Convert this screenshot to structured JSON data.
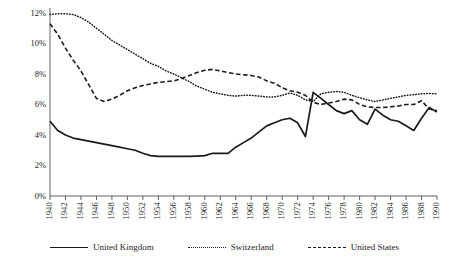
{
  "chart_data": {
    "type": "line",
    "title": "",
    "xlabel": "",
    "ylabel": "Capital/Assets Ratio",
    "xlim": [
      1940,
      1990
    ],
    "ylim": [
      0,
      12
    ],
    "grid": false,
    "legend_position": "bottom",
    "y_ticks": [
      "0%",
      "2%",
      "4%",
      "6%",
      "8%",
      "10%",
      "12%"
    ],
    "y_tick_values": [
      0,
      2,
      4,
      6,
      8,
      10,
      12
    ],
    "x_ticks": [
      "1940",
      "1942",
      "1944",
      "1946",
      "1948",
      "1950",
      "1952",
      "1954",
      "1956",
      "1958",
      "1960",
      "1962",
      "1964",
      "1966",
      "1968",
      "1970",
      "1972",
      "1974",
      "1976",
      "1978",
      "1980",
      "1982",
      "1984",
      "1986",
      "1988",
      "1990"
    ],
    "x": [
      1940,
      1941,
      1942,
      1943,
      1944,
      1945,
      1946,
      1947,
      1948,
      1949,
      1950,
      1951,
      1952,
      1953,
      1954,
      1955,
      1956,
      1957,
      1958,
      1959,
      1960,
      1961,
      1962,
      1963,
      1964,
      1965,
      1966,
      1967,
      1968,
      1969,
      1970,
      1971,
      1972,
      1973,
      1974,
      1975,
      1976,
      1977,
      1978,
      1979,
      1980,
      1981,
      1982,
      1983,
      1984,
      1985,
      1986,
      1987,
      1988,
      1989,
      1990
    ],
    "series": [
      {
        "name": "United Kingdom",
        "style": "solid",
        "color": "#1a1a1a",
        "values": [
          4.9,
          4.3,
          4.0,
          3.8,
          3.7,
          3.6,
          3.5,
          3.4,
          3.3,
          3.2,
          3.1,
          3.0,
          2.8,
          2.65,
          2.6,
          2.6,
          2.6,
          2.6,
          2.6,
          2.62,
          2.65,
          2.8,
          2.8,
          2.8,
          3.2,
          3.5,
          3.8,
          4.2,
          4.6,
          4.8,
          5.0,
          5.1,
          4.8,
          3.9,
          6.8,
          6.4,
          6.0,
          5.6,
          5.4,
          5.6,
          5.0,
          4.7,
          5.7,
          5.3,
          5.0,
          4.9,
          4.6,
          4.3,
          5.1,
          5.8,
          5.5
        ]
      },
      {
        "name": "Switzerland",
        "style": "dotted",
        "color": "#1a1a1a",
        "values": [
          11.9,
          11.95,
          11.95,
          11.9,
          11.7,
          11.4,
          11.0,
          10.6,
          10.2,
          9.9,
          9.6,
          9.3,
          9.0,
          8.7,
          8.5,
          8.2,
          8.0,
          7.75,
          7.5,
          7.2,
          7.0,
          6.8,
          6.7,
          6.6,
          6.55,
          6.6,
          6.6,
          6.55,
          6.5,
          6.5,
          6.6,
          6.75,
          6.6,
          6.3,
          6.2,
          6.7,
          6.8,
          6.85,
          6.8,
          6.6,
          6.45,
          6.3,
          6.2,
          6.3,
          6.4,
          6.5,
          6.6,
          6.65,
          6.7,
          6.72,
          6.7
        ]
      },
      {
        "name": "United States",
        "style": "dashed",
        "color": "#1a1a1a",
        "values": [
          11.3,
          10.6,
          9.7,
          8.9,
          8.2,
          7.3,
          6.4,
          6.2,
          6.35,
          6.6,
          6.9,
          7.1,
          7.25,
          7.35,
          7.45,
          7.5,
          7.55,
          7.7,
          7.9,
          8.1,
          8.25,
          8.3,
          8.2,
          8.1,
          8.0,
          7.95,
          7.9,
          7.8,
          7.55,
          7.4,
          7.1,
          6.9,
          6.8,
          6.6,
          6.15,
          6.0,
          6.1,
          6.2,
          6.35,
          6.3,
          6.0,
          5.85,
          5.8,
          5.8,
          5.85,
          5.9,
          6.0,
          6.0,
          6.25,
          5.7,
          5.6
        ]
      }
    ]
  },
  "legend": {
    "items": [
      {
        "label": "United Kingdom",
        "style": "solid"
      },
      {
        "label": "Switzerland",
        "style": "dotted"
      },
      {
        "label": "United States",
        "style": "dashed"
      }
    ]
  }
}
